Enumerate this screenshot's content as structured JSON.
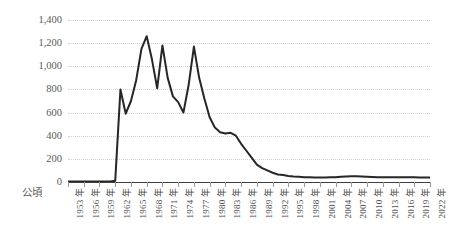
{
  "chart_data": {
    "type": "line",
    "title": "",
    "subtitle": "",
    "xlabel": "",
    "ylabel": "",
    "unit_label": "公頃",
    "grid": true,
    "legend": "none",
    "ylim": [
      0,
      1400
    ],
    "ytick_labels": [
      "1,400",
      "1,200",
      "1,000",
      "800",
      "600",
      "400",
      "200",
      "0"
    ],
    "ytick_values": [
      1400,
      1200,
      1000,
      800,
      600,
      400,
      200,
      0
    ],
    "xtick_labels": [
      "1953 年",
      "1956 年",
      "1959 年",
      "1962 年",
      "1965 年",
      "1968 年",
      "1971 年",
      "1974 年",
      "1977 年",
      "1980 年",
      "1983 年",
      "1986 年",
      "1989 年",
      "1992 年",
      "1995 年",
      "1998 年",
      "2001 年",
      "2004 年",
      "2007 年",
      "2010 年",
      "2013 年",
      "2016 年",
      "2019 年",
      "2022 年"
    ],
    "xtick_values": [
      1953,
      1956,
      1959,
      1962,
      1965,
      1968,
      1971,
      1974,
      1977,
      1980,
      1983,
      1986,
      1989,
      1992,
      1995,
      1998,
      2001,
      2004,
      2007,
      2010,
      2013,
      2016,
      2019,
      2022
    ],
    "xlim": [
      1953,
      2022
    ],
    "series": [
      {
        "name": "面積",
        "color": "#262626",
        "x": [
          1953,
          1954,
          1955,
          1956,
          1957,
          1958,
          1959,
          1960,
          1961,
          1962,
          1963,
          1964,
          1965,
          1966,
          1967,
          1968,
          1969,
          1970,
          1971,
          1972,
          1973,
          1974,
          1975,
          1976,
          1977,
          1978,
          1979,
          1980,
          1981,
          1982,
          1983,
          1984,
          1985,
          1986,
          1987,
          1988,
          1989,
          1990,
          1991,
          1992,
          1993,
          1994,
          1995,
          1996,
          1997,
          1998,
          1999,
          2000,
          2001,
          2002,
          2003,
          2004,
          2005,
          2006,
          2007,
          2008,
          2009,
          2010,
          2011,
          2012,
          2013,
          2014,
          2015,
          2016,
          2017,
          2018,
          2019,
          2020,
          2021,
          2022
        ],
        "values": [
          5,
          5,
          5,
          5,
          5,
          5,
          5,
          5,
          5,
          10,
          800,
          590,
          700,
          880,
          1150,
          1260,
          1060,
          810,
          1180,
          900,
          740,
          690,
          600,
          840,
          1170,
          900,
          720,
          560,
          470,
          430,
          420,
          425,
          400,
          330,
          270,
          210,
          150,
          120,
          100,
          80,
          65,
          60,
          52,
          48,
          45,
          42,
          40,
          38,
          38,
          38,
          40,
          42,
          45,
          48,
          50,
          50,
          48,
          46,
          44,
          42,
          40,
          40,
          40,
          40,
          40,
          40,
          40,
          38,
          38,
          38
        ]
      }
    ]
  }
}
